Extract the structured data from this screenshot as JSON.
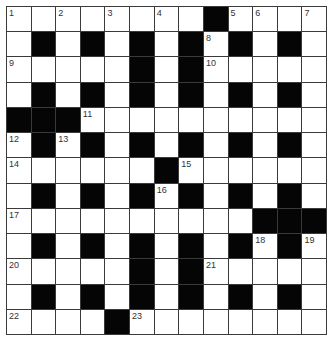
{
  "puzzle": {
    "rows": 13,
    "cols": 13,
    "layout": [
      "........#....",
      ".#.#.#.#.#.#.",
      ".....#.#.....",
      ".#.#.#.#.#.#.",
      "###..........",
      ".#.#.#.#.#.#.",
      "......#......",
      ".#.#.#.#.#.#.",
      "..........###",
      ".#.#.#.#.#.#.",
      ".....#.#.....",
      ".#.#.#.#.#.#.",
      "....#........"
    ],
    "numbers": [
      {
        "row": 0,
        "col": 0,
        "n": "1"
      },
      {
        "row": 0,
        "col": 2,
        "n": "2"
      },
      {
        "row": 0,
        "col": 4,
        "n": "3"
      },
      {
        "row": 0,
        "col": 6,
        "n": "4"
      },
      {
        "row": 0,
        "col": 9,
        "n": "5"
      },
      {
        "row": 0,
        "col": 10,
        "n": "6"
      },
      {
        "row": 0,
        "col": 12,
        "n": "7"
      },
      {
        "row": 1,
        "col": 8,
        "n": "8"
      },
      {
        "row": 2,
        "col": 0,
        "n": "9"
      },
      {
        "row": 2,
        "col": 8,
        "n": "10"
      },
      {
        "row": 4,
        "col": 3,
        "n": "11"
      },
      {
        "row": 5,
        "col": 0,
        "n": "12"
      },
      {
        "row": 5,
        "col": 2,
        "n": "13"
      },
      {
        "row": 6,
        "col": 0,
        "n": "14"
      },
      {
        "row": 6,
        "col": 7,
        "n": "15"
      },
      {
        "row": 7,
        "col": 6,
        "n": "16"
      },
      {
        "row": 8,
        "col": 0,
        "n": "17"
      },
      {
        "row": 9,
        "col": 10,
        "n": "18"
      },
      {
        "row": 9,
        "col": 12,
        "n": "19"
      },
      {
        "row": 10,
        "col": 0,
        "n": "20"
      },
      {
        "row": 10,
        "col": 8,
        "n": "21"
      },
      {
        "row": 12,
        "col": 0,
        "n": "22"
      },
      {
        "row": 12,
        "col": 5,
        "n": "23"
      }
    ]
  },
  "colors": {
    "block": "#050505",
    "cell": "#ffffff",
    "grid_line": "#3a3a3a",
    "number": "#333333"
  }
}
